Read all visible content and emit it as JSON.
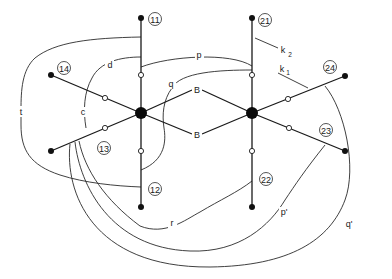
{
  "diagram": {
    "title": "",
    "hubs": [
      {
        "id": "hub-1",
        "x": 141,
        "y": 113
      },
      {
        "id": "hub-2",
        "x": 252,
        "y": 113
      }
    ],
    "leaf_labels": {
      "n11": "11",
      "n12": "12",
      "n13": "13",
      "n14": "14",
      "n21": "21",
      "n22": "22",
      "n23": "23",
      "n24": "24"
    },
    "edge_labels": {
      "B_upper": "B",
      "B_lower": "B"
    },
    "curve_labels": {
      "p": "p",
      "q": "q",
      "d": "d",
      "c": "c",
      "t": "t",
      "r": "r",
      "p_prime": "p'",
      "q_prime": "q'",
      "k1": "k",
      "k1_sub": "1",
      "k2": "k",
      "k2_sub": "2"
    }
  }
}
